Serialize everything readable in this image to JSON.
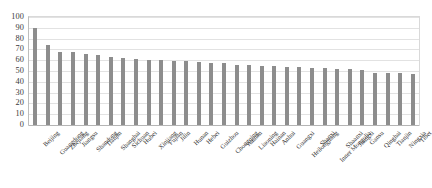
{
  "chart_data": {
    "type": "bar",
    "title": "",
    "subtitle": "",
    "xlabel": "",
    "ylabel": "",
    "ylim": [
      0,
      100
    ],
    "yticks": [
      100,
      90,
      80,
      70,
      60,
      50,
      40,
      30,
      20,
      10,
      0
    ],
    "grid": true,
    "legend": false,
    "legend_position": "none",
    "bar_color": "#8d8d8d",
    "gridline_color": "#e2e2e2",
    "axis_color": "#bdbdbd",
    "categories": [
      "Beijing",
      "Guangdong",
      "Zhejiang",
      "Jiangsu",
      "Shandong",
      "Tianjin",
      "Shanghai",
      "Sichuan",
      "Hubei",
      "Xinjiang",
      "Fujian",
      "Jilin",
      "Hunan",
      "Hebei",
      "Guizhou",
      "Chongqing",
      "Yunnan",
      "Liaoning",
      "Hainan",
      "Anhui",
      "Guangxi",
      "Heilongjiang",
      "Shanxi",
      "Inner Mongolia",
      "Shaanxi",
      "Jiangxi",
      "Gansu",
      "Qinghai",
      "Tianjin",
      "Ningxia",
      "Tibet"
    ],
    "values": [
      90,
      74,
      68,
      68,
      66,
      65,
      63,
      62,
      61,
      60,
      60,
      59,
      59,
      58,
      57,
      57,
      56,
      56,
      55,
      55,
      54,
      54,
      53,
      53,
      52,
      52,
      51,
      48,
      48,
      48,
      47
    ]
  }
}
